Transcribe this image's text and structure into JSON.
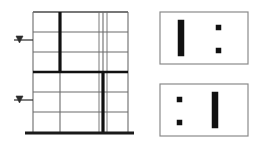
{
  "figure": {
    "type": "structural-frame-diagram",
    "title": "",
    "background_color": "#ffffff",
    "width": 259,
    "height": 147
  },
  "colors": {
    "thin_line": "#6b6b6b",
    "medium_line": "#4a4a4a",
    "thick_line": "#111111",
    "box_border": "#8a8a8a",
    "ground_line": "#1a1a1a",
    "marker_fill": "#111111",
    "arrow_color": "#2b2b2b"
  },
  "elevation": {
    "name": "frame-elevation",
    "label": "",
    "bounds": {
      "x": 33,
      "y": 12,
      "width": 95,
      "height": 122
    },
    "bays": 3,
    "stories": 6,
    "column_x": [
      33,
      60,
      103,
      128
    ],
    "secondary_column_x": [
      99,
      107
    ],
    "floor_y": [
      12,
      32,
      52,
      72,
      92,
      112,
      131
    ],
    "ground_line": {
      "x1": 25,
      "x2": 134,
      "y": 133,
      "thickness": 3
    },
    "strong_columns": [
      {
        "name": "upper-stiff-column",
        "x": 60,
        "y_top": 12,
        "y_bottom": 72,
        "thickness": 3.2
      },
      {
        "name": "lower-stiff-column",
        "x": 103,
        "y_top": 72,
        "y_bottom": 133,
        "thickness": 3.2
      }
    ],
    "transfer_beam": {
      "name": "transfer-beam",
      "y": 72,
      "x1": 33,
      "x2": 128,
      "thickness": 2.6
    },
    "thin_beams_y": [
      32,
      52,
      92,
      112
    ],
    "roof_beam_y": 12
  },
  "loads": {
    "arrows": [
      {
        "name": "lateral-load-arrow-upper",
        "x": 14,
        "y": 40,
        "length": 19,
        "direction": "right",
        "label": ""
      },
      {
        "name": "lateral-load-arrow-lower",
        "x": 14,
        "y": 100,
        "length": 19,
        "direction": "right",
        "label": ""
      }
    ]
  },
  "plans": [
    {
      "name": "plan-upper-stories",
      "label": "",
      "bounds": {
        "x": 160,
        "y": 12,
        "width": 88,
        "height": 52
      },
      "wall": {
        "name": "shear-wall",
        "x": 178,
        "y": 20,
        "width": 6,
        "height": 36,
        "orientation": "vertical"
      },
      "columns": [
        {
          "name": "plan-column",
          "x": 216,
          "y": 25,
          "size": 5
        },
        {
          "name": "plan-column",
          "x": 216,
          "y": 48,
          "size": 5
        }
      ]
    },
    {
      "name": "plan-lower-stories",
      "label": "",
      "bounds": {
        "x": 160,
        "y": 84,
        "width": 88,
        "height": 52
      },
      "wall": {
        "name": "shear-wall",
        "x": 212,
        "y": 92,
        "width": 6,
        "height": 36,
        "orientation": "vertical"
      },
      "columns": [
        {
          "name": "plan-column",
          "x": 177,
          "y": 97,
          "size": 5
        },
        {
          "name": "plan-column",
          "x": 177,
          "y": 120,
          "size": 5
        }
      ]
    }
  ]
}
